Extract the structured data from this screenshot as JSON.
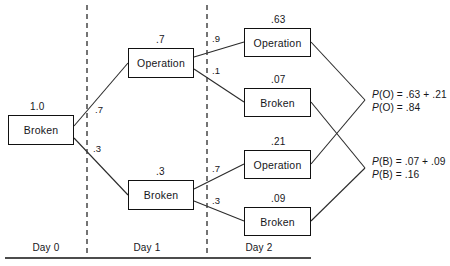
{
  "diagram": {
    "baseline_color": "#111111",
    "divider_color": "#3a3a3a",
    "line_color": "#2b2b2b",
    "box_border_color": "#111111",
    "text_color": "#16161a"
  },
  "nodes": [
    {
      "id": "root",
      "label": "Broken",
      "prob": "1.0",
      "x": 8,
      "y": 115,
      "w": 66,
      "h": 30,
      "prob_x": 30,
      "prob_y": 101
    },
    {
      "id": "d1_op",
      "label": "Operation",
      "prob": ".7",
      "x": 128,
      "y": 48,
      "w": 66,
      "h": 30,
      "prob_x": 156,
      "prob_y": 34
    },
    {
      "id": "d1_br",
      "label": "Broken",
      "prob": ".3",
      "x": 128,
      "y": 180,
      "w": 66,
      "h": 30,
      "prob_x": 156,
      "prob_y": 166
    },
    {
      "id": "d2_op1",
      "label": "Operation",
      "prob": ".63",
      "x": 244,
      "y": 28,
      "w": 67,
      "h": 29,
      "prob_x": 271,
      "prob_y": 14
    },
    {
      "id": "d2_br1",
      "label": "Broken",
      "prob": ".07",
      "x": 244,
      "y": 88,
      "w": 67,
      "h": 29,
      "prob_x": 271,
      "prob_y": 74
    },
    {
      "id": "d2_op2",
      "label": "Operation",
      "prob": ".21",
      "x": 244,
      "y": 150,
      "w": 67,
      "h": 29,
      "prob_x": 271,
      "prob_y": 136
    },
    {
      "id": "d2_br2",
      "label": "Broken",
      "prob": ".09",
      "x": 244,
      "y": 207,
      "w": 67,
      "h": 29,
      "prob_x": 271,
      "prob_y": 193
    }
  ],
  "edges": [
    {
      "id": "root-d1op",
      "from": "root",
      "to": "d1_op",
      "weight": ".7",
      "x1": 74,
      "y1": 126,
      "x2": 128,
      "y2": 63,
      "label_x": 95,
      "label_y": 104
    },
    {
      "id": "root-d1br",
      "from": "root",
      "to": "d1_br",
      "weight": ".3",
      "x1": 74,
      "y1": 138,
      "x2": 128,
      "y2": 195,
      "label_x": 93,
      "label_y": 143
    },
    {
      "id": "d1op-d2op1",
      "from": "d1_op",
      "to": "d2_op1",
      "weight": ".9",
      "x1": 194,
      "y1": 57,
      "x2": 244,
      "y2": 42,
      "label_x": 212,
      "label_y": 33
    },
    {
      "id": "d1op-d2br1",
      "from": "d1_op",
      "to": "d2_br1",
      "weight": ".1",
      "x1": 194,
      "y1": 69,
      "x2": 244,
      "y2": 102,
      "label_x": 212,
      "label_y": 65
    },
    {
      "id": "d1br-d2op2",
      "from": "d1_br",
      "to": "d2_op2",
      "weight": ".7",
      "x1": 194,
      "y1": 189,
      "x2": 244,
      "y2": 164,
      "label_x": 212,
      "label_y": 163
    },
    {
      "id": "d1br-d2br2",
      "from": "d1_br",
      "to": "d2_br2",
      "weight": ".3",
      "x1": 194,
      "y1": 201,
      "x2": 244,
      "y2": 221,
      "label_x": 212,
      "label_y": 195
    }
  ],
  "converge_edges": [
    {
      "id": "d2op1-sumO",
      "x1": 311,
      "y1": 42,
      "x2": 365,
      "y2": 100
    },
    {
      "id": "d2op2-sumO",
      "x1": 311,
      "y1": 164,
      "x2": 365,
      "y2": 100
    },
    {
      "id": "d2br1-sumB",
      "x1": 311,
      "y1": 102,
      "x2": 365,
      "y2": 168
    },
    {
      "id": "d2br2-sumB",
      "x1": 311,
      "y1": 221,
      "x2": 365,
      "y2": 168
    }
  ],
  "equations": [
    {
      "id": "sum-operation",
      "x": 372,
      "y": 88,
      "lines": [
        "P(O)  =  .63  +  .21",
        "P(O)  =  .84"
      ]
    },
    {
      "id": "sum-broken",
      "x": 372,
      "y": 155,
      "lines": [
        "P(B)  =  .07  +  .09",
        "P(B)  =  .16"
      ]
    }
  ],
  "dividers": [
    {
      "id": "divider-day0-day1",
      "x": 87,
      "y1": 5,
      "y2": 257
    },
    {
      "id": "divider-day1-day2",
      "x": 207,
      "y1": 5,
      "y2": 257
    }
  ],
  "baseline": {
    "x1": 5,
    "x2": 311,
    "y": 258
  },
  "day_labels": [
    {
      "id": "day-0",
      "text": "Day 0",
      "cx": 46,
      "y": 242
    },
    {
      "id": "day-1",
      "text": "Day 1",
      "cx": 147,
      "y": 242
    },
    {
      "id": "day-2",
      "text": "Day 2",
      "cx": 259,
      "y": 242
    }
  ]
}
